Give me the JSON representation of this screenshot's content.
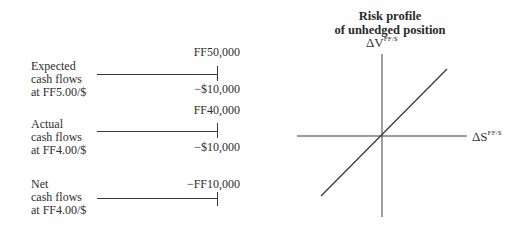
{
  "rows": [
    {
      "label_lines": [
        "Expected",
        "cash flows",
        "at FF5.00/$"
      ],
      "inflow": "FF50,000",
      "outflow": "−$10,000"
    },
    {
      "label_lines": [
        "Actual",
        "cash flows",
        "at FF4.00/$"
      ],
      "inflow": "FF40,000",
      "outflow": "−$10,000"
    },
    {
      "label_lines": [
        "Net",
        "cash flows",
        "at FF4.00/$"
      ],
      "inflow": "−FF10,000",
      "outflow": ""
    }
  ],
  "risk_profile": {
    "title_lines": [
      "Risk profile",
      "of unhedged position"
    ],
    "y_axis": {
      "symbol": "ΔV",
      "superscript": "FF/$"
    },
    "x_axis": {
      "symbol": "ΔS",
      "superscript": "FF/$"
    },
    "line": "positive slope through origin"
  },
  "colors": {
    "ink": "#3a3a3a",
    "background": "#ffffff"
  }
}
